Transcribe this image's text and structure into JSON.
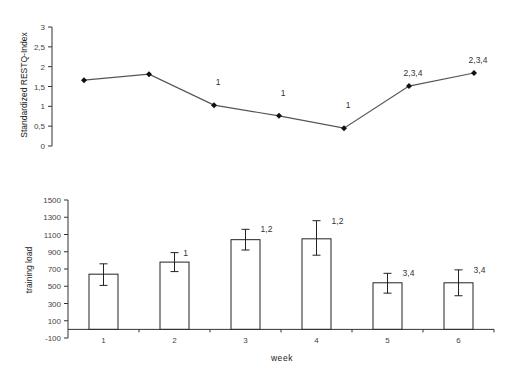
{
  "chart_data": [
    {
      "type": "line",
      "title": "",
      "xlabel": "",
      "ylabel": "Standardized RESTQ-Index",
      "ylim": [
        0,
        3
      ],
      "yticks": [
        "0",
        "0,5",
        "1",
        "1,5",
        "2",
        "2,5",
        "3"
      ],
      "ytick_values": [
        0,
        0.5,
        1,
        1.5,
        2,
        2.5,
        3
      ],
      "x": [
        1,
        2,
        3,
        4,
        5,
        6,
        7
      ],
      "series": [
        {
          "name": "RESTQ",
          "values": [
            1.66,
            1.81,
            1.03,
            0.76,
            0.45,
            1.51,
            1.84
          ]
        }
      ],
      "annotations": [
        "",
        "",
        "1",
        "1",
        "1",
        "2,3,4",
        "2,3,4"
      ],
      "grid": false
    },
    {
      "type": "bar",
      "title": "",
      "xlabel": "week",
      "ylabel": "training load",
      "ylim": [
        -100,
        1500
      ],
      "yticks": [
        "-100",
        "100",
        "300",
        "500",
        "700",
        "900",
        "1100",
        "1300",
        "1500"
      ],
      "ytick_values": [
        -100,
        100,
        300,
        500,
        700,
        900,
        1100,
        1300,
        1500
      ],
      "categories": [
        "1",
        "2",
        "3",
        "4",
        "5",
        "6"
      ],
      "values": [
        640,
        780,
        1040,
        1050,
        540,
        540
      ],
      "error_upper": [
        760,
        890,
        1160,
        1260,
        650,
        690
      ],
      "error_lower": [
        510,
        670,
        920,
        860,
        420,
        390
      ],
      "annotations": [
        "",
        "1",
        "1,2",
        "1,2",
        "3,4",
        "3,4"
      ],
      "grid": false
    }
  ]
}
